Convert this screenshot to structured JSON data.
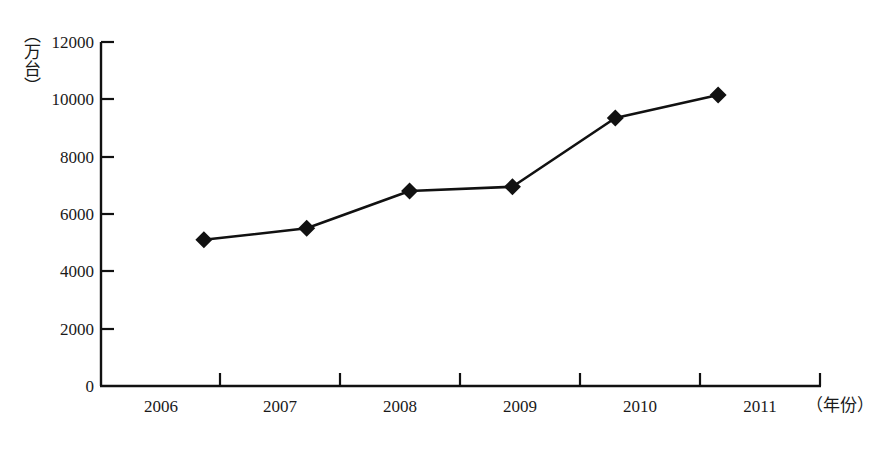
{
  "chart_data": {
    "type": "line",
    "title": "",
    "subtitle": "",
    "xlabel": "（年份）",
    "ylabel": "（万台）",
    "categories": [
      "2006",
      "2007",
      "2008",
      "2009",
      "2010",
      "2011"
    ],
    "values": [
      5100,
      5500,
      6800,
      6950,
      9350,
      10150
    ],
    "series": [
      {
        "name": "",
        "values": [
          5100,
          5500,
          6800,
          6950,
          9350,
          10150
        ],
        "marker": "diamond",
        "color": "#111111"
      }
    ],
    "xlim": [
      0,
      7
    ],
    "ylim": [
      0,
      12000
    ],
    "ytick_labels": [
      "0",
      "2000",
      "4000",
      "6000",
      "8000",
      "10000",
      "12000"
    ],
    "ytick_values": [
      0,
      2000,
      4000,
      6000,
      8000,
      10000,
      12000
    ],
    "xtick_labels": [
      "2006",
      "2007",
      "2008",
      "2009",
      "2010",
      "2011"
    ],
    "grid": "off",
    "legend": "none",
    "axis_color": "#111111",
    "background": "#ffffff"
  },
  "axes": {
    "y_axis_title": "（万台）",
    "x_axis_title": "（年份）",
    "y_labels": {
      "t0": "0",
      "t1": "2000",
      "t2": "4000",
      "t3": "6000",
      "t4": "8000",
      "t5": "10000",
      "t6": "12000"
    },
    "x_labels": {
      "c0": "2006",
      "c1": "2007",
      "c2": "2008",
      "c3": "2009",
      "c4": "2010",
      "c5": "2011"
    }
  }
}
